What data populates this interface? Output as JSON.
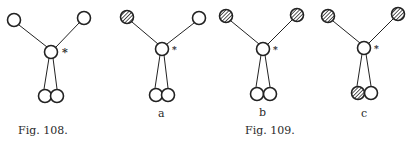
{
  "colors": {
    "ink": "#222222",
    "paper": "#ffffff"
  },
  "figures": [
    {
      "id": "fig108",
      "caption": "Fig. 108.",
      "sublabel": "",
      "star": "*",
      "nodes": {
        "top_left": {
          "x": 14,
          "y": 20,
          "hatched": false
        },
        "top_right": {
          "x": 84,
          "y": 18,
          "hatched": false
        },
        "center": {
          "x": 51,
          "y": 52,
          "hatched": false
        },
        "bottom_left": {
          "x": 45,
          "y": 96,
          "hatched": false
        },
        "bottom_right": {
          "x": 57,
          "y": 96,
          "hatched": false
        }
      }
    },
    {
      "id": "fig109a",
      "caption": "",
      "sublabel": "a",
      "star": "*",
      "nodes": {
        "top_left": {
          "x": 127,
          "y": 17,
          "hatched": true
        },
        "top_right": {
          "x": 199,
          "y": 18,
          "hatched": false
        },
        "center": {
          "x": 162,
          "y": 49,
          "hatched": false
        },
        "bottom_left": {
          "x": 156,
          "y": 95,
          "hatched": false
        },
        "bottom_right": {
          "x": 168,
          "y": 95,
          "hatched": false
        }
      }
    },
    {
      "id": "fig109b",
      "caption": "",
      "sublabel": "b",
      "star": "*",
      "nodes": {
        "top_left": {
          "x": 226,
          "y": 16,
          "hatched": true
        },
        "top_right": {
          "x": 297,
          "y": 15,
          "hatched": true
        },
        "center": {
          "x": 263,
          "y": 49,
          "hatched": false
        },
        "bottom_left": {
          "x": 257,
          "y": 94,
          "hatched": false
        },
        "bottom_right": {
          "x": 270,
          "y": 94,
          "hatched": false
        }
      }
    },
    {
      "id": "fig109c",
      "caption": "",
      "sublabel": "c",
      "star": "*",
      "nodes": {
        "top_left": {
          "x": 328,
          "y": 16,
          "hatched": true
        },
        "top_right": {
          "x": 398,
          "y": 14,
          "hatched": true
        },
        "center": {
          "x": 364,
          "y": 48,
          "hatched": false
        },
        "bottom_left": {
          "x": 358,
          "y": 93,
          "hatched": true
        },
        "bottom_right": {
          "x": 371,
          "y": 93,
          "hatched": false
        }
      }
    }
  ],
  "captions": {
    "fig108": "Fig. 108.",
    "fig109": "Fig. 109.",
    "sub_a": "a",
    "sub_b": "b",
    "sub_c": "c"
  }
}
